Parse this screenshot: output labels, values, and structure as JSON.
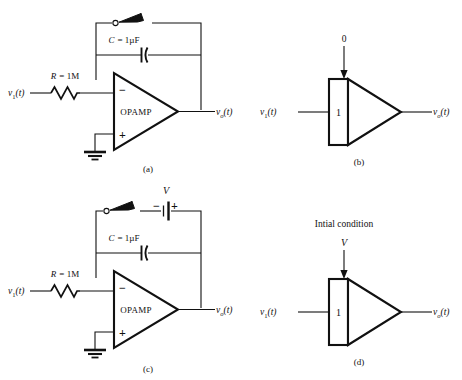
{
  "figure": {
    "ink_color": "#111111",
    "background": "#ffffff"
  },
  "panels": [
    {
      "id": "a",
      "caption": "(a)",
      "kind": "opamp-integrator",
      "input_label": "v",
      "input_sub": "1",
      "input_arg": "(t)",
      "output_label": "v",
      "output_sub": "o",
      "output_arg": "(t)",
      "resistor_label_sym": "R",
      "resistor_label_eq": "= 1M",
      "capacitor_label_sym": "C",
      "capacitor_label_eq": "= 1µF",
      "amp_label": "OPAMP",
      "inverting_sign": "−",
      "noninverting_sign": "+",
      "has_switch": true,
      "has_battery": false,
      "has_ground": true
    },
    {
      "id": "b",
      "caption": "(b)",
      "kind": "integrator-block",
      "input_label": "v",
      "input_sub": "1",
      "input_arg": "(t)",
      "output_label": "v",
      "output_sub": "o",
      "output_arg": "(t)",
      "gain_label": "1",
      "ic_title": "",
      "ic_value": "0"
    },
    {
      "id": "c",
      "caption": "(c)",
      "kind": "opamp-integrator",
      "input_label": "v",
      "input_sub": "1",
      "input_arg": "(t)",
      "output_label": "v",
      "output_sub": "o",
      "output_arg": "(t)",
      "resistor_label_sym": "R",
      "resistor_label_eq": "= 1M",
      "capacitor_label_sym": "C",
      "capacitor_label_eq": "= 1µF",
      "amp_label": "OPAMP",
      "inverting_sign": "−",
      "noninverting_sign": "+",
      "has_switch": true,
      "has_battery": true,
      "battery_label": "V",
      "battery_minus": "−",
      "battery_plus": "+",
      "has_ground": true
    },
    {
      "id": "d",
      "caption": "(d)",
      "kind": "integrator-block",
      "input_label": "v",
      "input_sub": "1",
      "input_arg": "(t)",
      "output_label": "v",
      "output_sub": "o",
      "output_arg": "(t)",
      "gain_label": "1",
      "ic_title": "Intial condition",
      "ic_value": "V"
    }
  ]
}
